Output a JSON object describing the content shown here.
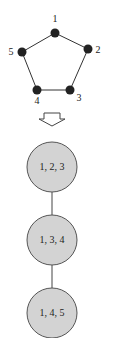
{
  "graph": {
    "nodes": [
      {
        "id": "1",
        "label": "1",
        "x": 55,
        "y": 33,
        "lx": 55,
        "ly": 22
      },
      {
        "id": "2",
        "label": "2",
        "x": 88,
        "y": 49,
        "lx": 98,
        "ly": 53
      },
      {
        "id": "3",
        "label": "3",
        "x": 70,
        "y": 90,
        "lx": 79,
        "ly": 101
      },
      {
        "id": "4",
        "label": "4",
        "x": 37,
        "y": 90,
        "lx": 37,
        "ly": 103
      },
      {
        "id": "5",
        "label": "5",
        "x": 22,
        "y": 52,
        "lx": 11,
        "ly": 54
      }
    ],
    "edges": [
      [
        "1",
        "2"
      ],
      [
        "2",
        "3"
      ],
      [
        "3",
        "4"
      ],
      [
        "4",
        "5"
      ],
      [
        "5",
        "1"
      ]
    ]
  },
  "tree": {
    "nodes": [
      {
        "label": "1, 2, 3",
        "cx": 52,
        "cy": 167
      },
      {
        "label": "1, 3, 4",
        "cx": 52,
        "cy": 240
      },
      {
        "label": "1, 4, 5",
        "cx": 52,
        "cy": 313
      }
    ],
    "radius": 25,
    "fill": "#d3d3d3"
  }
}
